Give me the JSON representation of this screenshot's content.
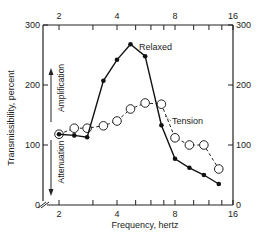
{
  "chart_data": {
    "type": "line",
    "title": "",
    "xlabel": "Frequency, hertz",
    "ylabel": "Transmissibility, percent",
    "x_scale": "log2",
    "xlim": [
      2,
      16
    ],
    "ylim": [
      0,
      300
    ],
    "x_ticks": [
      2,
      4,
      8,
      16
    ],
    "x_tick_labels": [
      "2",
      "4",
      "8",
      "16"
    ],
    "y_ticks": [
      0,
      100,
      200,
      300
    ],
    "y_tick_labels": [
      "0",
      "100",
      "200",
      "300"
    ],
    "right_y_tick_labels": [
      "0",
      "100",
      "200",
      "300"
    ],
    "top_x_tick_labels": [
      "2",
      "4",
      "8",
      "16"
    ],
    "grid": false,
    "annotations": [
      {
        "text": "Amplification",
        "direction": "up"
      },
      {
        "text": "Attenuation",
        "direction": "down"
      }
    ],
    "series": [
      {
        "name": "Relaxed",
        "style": "solid line, filled circles",
        "x": [
          2.0,
          2.4,
          2.8,
          3.4,
          4.0,
          4.7,
          5.6,
          6.8,
          8.0,
          9.5,
          11.3,
          13.5
        ],
        "values": [
          118,
          116,
          113,
          207,
          242,
          268,
          248,
          133,
          77,
          62,
          50,
          35
        ]
      },
      {
        "name": "Tension",
        "style": "dashed line, open circles",
        "x": [
          2.0,
          2.4,
          2.8,
          3.4,
          4.0,
          4.7,
          5.6,
          6.8,
          8.0,
          9.5,
          11.3,
          13.5
        ],
        "values": [
          118,
          128,
          128,
          132,
          140,
          160,
          170,
          168,
          112,
          100,
          100,
          60
        ]
      }
    ]
  },
  "labels": {
    "xlabel": "Frequency, hertz",
    "ylabel": "Transmissibility, percent",
    "amplification": "Amplification",
    "attenuation": "Attenuation",
    "relaxed": "Relaxed",
    "tension": "Tension"
  }
}
